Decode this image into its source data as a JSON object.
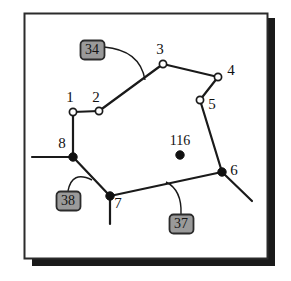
{
  "figure": {
    "type": "polygon-network-diagram",
    "frame": {
      "x": 24,
      "y": 13,
      "width": 243,
      "height": 245,
      "border_color": "#2b2b2b",
      "fill_color": "#ffffff",
      "shadow_color": "#1a1a1a",
      "shadow_offset": 8
    },
    "colors": {
      "line": "#1a1a1a",
      "open_node_fill": "#ffffff",
      "filled_node": "#111111",
      "box_fill": "#9a9a9a",
      "box_border": "#2b2b2b",
      "box_text": "#141414",
      "label_text": "#111111"
    },
    "nodes": [
      {
        "id": "1",
        "label": "1",
        "x": 73,
        "y": 112,
        "style": "open",
        "label_x": 70,
        "label_y": 99
      },
      {
        "id": "2",
        "label": "2",
        "x": 99,
        "y": 111,
        "style": "open",
        "label_x": 96,
        "label_y": 99
      },
      {
        "id": "3",
        "label": "3",
        "x": 163,
        "y": 64,
        "style": "open",
        "label_x": 160,
        "label_y": 51
      },
      {
        "id": "4",
        "label": "4",
        "x": 218,
        "y": 77,
        "style": "open",
        "label_x": 231,
        "label_y": 72
      },
      {
        "id": "5",
        "label": "5",
        "x": 200,
        "y": 100,
        "style": "open",
        "label_x": 212,
        "label_y": 106
      },
      {
        "id": "6",
        "label": "6",
        "x": 222,
        "y": 172,
        "style": "filled",
        "label_x": 234,
        "label_y": 172
      },
      {
        "id": "7",
        "label": "7",
        "x": 110,
        "y": 196,
        "style": "filled",
        "label_x": 118,
        "label_y": 205
      },
      {
        "id": "8",
        "label": "8",
        "x": 73,
        "y": 157,
        "style": "filled",
        "label_x": 62,
        "label_y": 145
      },
      {
        "id": "116",
        "label": "116",
        "x": 180,
        "y": 155,
        "style": "filled",
        "label_x": 180,
        "label_y": 142
      }
    ],
    "edges": [
      {
        "from": "1",
        "to": "2"
      },
      {
        "from": "2",
        "to": "3"
      },
      {
        "from": "3",
        "to": "4"
      },
      {
        "from": "4",
        "to": "5"
      },
      {
        "from": "5",
        "to": "6"
      },
      {
        "from": "6",
        "to": "7"
      },
      {
        "from": "7",
        "to": "8"
      },
      {
        "from": "8",
        "to": "1"
      }
    ],
    "stubs": [
      {
        "name": "stub-at-8-left",
        "x1": 73,
        "y1": 157,
        "x2": 32,
        "y2": 157
      },
      {
        "name": "stub-at-7-down",
        "x1": 110,
        "y1": 196,
        "x2": 110,
        "y2": 224
      },
      {
        "name": "stub-at-6-down",
        "x1": 222,
        "y1": 172,
        "x2": 252,
        "y2": 201
      }
    ],
    "callouts": [
      {
        "id": "34",
        "label": "34",
        "box": {
          "x": 80,
          "y": 40,
          "width": 24,
          "height": 19
        },
        "leader": {
          "start_x": 104,
          "start_y": 47,
          "ctrl_x": 140,
          "ctrl_y": 50,
          "end_x": 145,
          "end_y": 80
        }
      },
      {
        "id": "38",
        "label": "38",
        "box": {
          "x": 56,
          "y": 191,
          "width": 24,
          "height": 19
        },
        "leader": {
          "start_x": 68,
          "start_y": 191,
          "ctrl_x": 72,
          "ctrl_y": 170,
          "end_x": 92,
          "end_y": 180
        }
      },
      {
        "id": "37",
        "label": "37",
        "box": {
          "x": 169,
          "y": 214,
          "width": 24,
          "height": 19
        },
        "leader": {
          "start_x": 181,
          "start_y": 214,
          "ctrl_x": 182,
          "ctrl_y": 190,
          "end_x": 166,
          "end_y": 182
        }
      }
    ]
  }
}
